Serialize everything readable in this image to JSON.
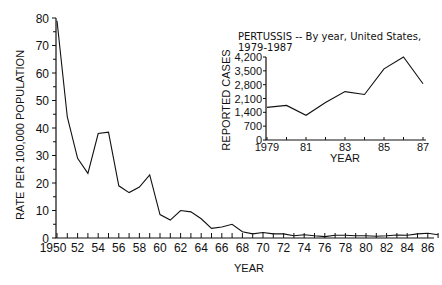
{
  "chart_data": [
    {
      "type": "line",
      "title": "",
      "xlabel": "YEAR",
      "ylabel": "RATE PER 100,000 POPULATION",
      "ylim": [
        0,
        80
      ],
      "yticks": [
        0,
        10,
        20,
        30,
        40,
        50,
        60,
        70,
        80
      ],
      "xtick_labels": [
        "1950",
        "52",
        "54",
        "56",
        "58",
        "60",
        "62",
        "64",
        "66",
        "68",
        "70",
        "72",
        "74",
        "76",
        "78",
        "80",
        "82",
        "84",
        "86"
      ],
      "grid": false,
      "x": [
        1950,
        1951,
        1952,
        1953,
        1954,
        1955,
        1956,
        1957,
        1958,
        1959,
        1960,
        1961,
        1962,
        1963,
        1964,
        1965,
        1966,
        1967,
        1968,
        1969,
        1970,
        1971,
        1972,
        1973,
        1974,
        1975,
        1976,
        1977,
        1978,
        1979,
        1980,
        1981,
        1982,
        1983,
        1984,
        1985,
        1986,
        1987
      ],
      "series": [
        {
          "name": "Pertussis rate",
          "values": [
            79,
            44,
            29,
            23.5,
            38,
            38.5,
            19,
            16.5,
            18.5,
            23,
            8.5,
            6.5,
            10,
            9.5,
            7,
            3.5,
            4,
            5,
            2.3,
            1.5,
            2,
            1.5,
            1.5,
            0.8,
            1.2,
            0.8,
            0.5,
            1,
            1,
            0.8,
            0.8,
            0.6,
            0.8,
            1.1,
            1,
            1.5,
            1.7,
            1.2
          ]
        }
      ]
    },
    {
      "type": "line",
      "title": "PERTUSSIS -- By year, United States, 1979-1987",
      "xlabel": "YEAR",
      "ylabel": "REPORTED CASES",
      "ylim": [
        0,
        4200
      ],
      "yticks": [
        "0",
        "700",
        "1,400",
        "2,100",
        "2,800",
        "3,500",
        "4,200"
      ],
      "xtick_labels": [
        "1979",
        "81",
        "83",
        "85",
        "87"
      ],
      "grid": false,
      "legend": "inset, upper right",
      "x": [
        1979,
        1980,
        1981,
        1982,
        1983,
        1984,
        1985,
        1986,
        1987
      ],
      "series": [
        {
          "name": "Reported cases",
          "values": [
            1650,
            1750,
            1250,
            1900,
            2450,
            2300,
            3600,
            4200,
            2850
          ]
        }
      ]
    }
  ],
  "main": {
    "ylabel": "RATE PER 100,000 POPULATION",
    "xlabel": "YEAR",
    "yticks": [
      "0",
      "10",
      "20",
      "30",
      "40",
      "50",
      "60",
      "70",
      "80"
    ],
    "xticks": [
      "1950",
      "52",
      "54",
      "56",
      "58",
      "60",
      "62",
      "64",
      "66",
      "68",
      "70",
      "72",
      "74",
      "76",
      "78",
      "80",
      "82",
      "84",
      "86"
    ]
  },
  "inset": {
    "title_line1": "PERTUSSIS -- By year, United States,",
    "title_line2": "1979-1987",
    "ylabel": "REPORTED CASES",
    "xlabel": "YEAR",
    "yticks": [
      "0",
      "700",
      "1,400",
      "2,100",
      "2,800",
      "3,500",
      "4,200"
    ],
    "xticks": [
      "1979",
      "81",
      "83",
      "85",
      "87"
    ]
  }
}
